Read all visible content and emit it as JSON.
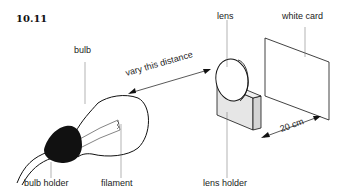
{
  "figure": {
    "number": "10.11",
    "labels": {
      "bulb": "bulb",
      "lens": "lens",
      "white_card": "white card",
      "vary_distance": "vary this distance",
      "distance": "20 cm",
      "bulb_holder": "bulb holder",
      "filament": "filament",
      "lens_holder": "lens holder"
    }
  }
}
